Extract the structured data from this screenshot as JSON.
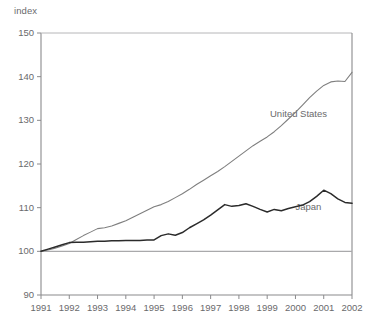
{
  "chart_data": {
    "type": "line",
    "title": "",
    "subtitle": "",
    "xlabel": "",
    "ylabel": "index",
    "unit_label": "index",
    "xlim": [
      1991,
      2002
    ],
    "ylim": [
      90,
      150
    ],
    "grid": false,
    "legend_position": "inline-annotation",
    "reference_line": 100,
    "ytick_labels": [
      "150",
      "140",
      "130",
      "120",
      "110",
      "100",
      "90"
    ],
    "ytick_values": [
      150,
      140,
      130,
      120,
      110,
      100,
      90
    ],
    "xtick_labels": [
      "1991",
      "1992",
      "1993",
      "1994",
      "1995",
      "1996",
      "1997",
      "1998",
      "1999",
      "2000",
      "2001",
      "2002"
    ],
    "xtick_values": [
      1991,
      1992,
      1993,
      1994,
      1995,
      1996,
      1997,
      1998,
      1999,
      2000,
      2001,
      2002
    ],
    "series": [
      {
        "name": "United States",
        "label": "United States",
        "color": "#7f7f7f",
        "annotation_x": 1999.1,
        "annotation_y": 131.2,
        "x": [
          1991.0,
          1991.25,
          1991.5,
          1991.75,
          1992.0,
          1992.25,
          1992.5,
          1992.75,
          1993.0,
          1993.25,
          1993.5,
          1993.75,
          1994.0,
          1994.25,
          1994.5,
          1994.75,
          1995.0,
          1995.25,
          1995.5,
          1995.75,
          1996.0,
          1996.25,
          1996.5,
          1996.75,
          1997.0,
          1997.25,
          1997.5,
          1997.75,
          1998.0,
          1998.25,
          1998.5,
          1998.75,
          1999.0,
          1999.25,
          1999.5,
          1999.75,
          2000.0,
          2000.25,
          2000.5,
          2000.75,
          2001.0,
          2001.25,
          2001.5,
          2001.75,
          2002.0
        ],
        "values": [
          100.0,
          100.3,
          100.7,
          101.2,
          101.8,
          102.7,
          103.6,
          104.4,
          105.2,
          105.4,
          105.8,
          106.4,
          107.0,
          107.8,
          108.6,
          109.4,
          110.2,
          110.7,
          111.4,
          112.3,
          113.2,
          114.2,
          115.3,
          116.3,
          117.3,
          118.3,
          119.4,
          120.6,
          121.8,
          123.0,
          124.2,
          125.2,
          126.2,
          127.4,
          128.8,
          130.3,
          131.8,
          133.5,
          135.2,
          136.7,
          138.0,
          138.8,
          139.0,
          138.9,
          141.0
        ]
      },
      {
        "name": "Japan",
        "label": "Japan",
        "color": "#2b2b2b",
        "annotation_x": 2000.0,
        "annotation_y": 110.0,
        "x": [
          1991.0,
          1991.25,
          1991.5,
          1991.75,
          1992.0,
          1992.25,
          1992.5,
          1992.75,
          1993.0,
          1993.25,
          1993.5,
          1993.75,
          1994.0,
          1994.25,
          1994.5,
          1994.75,
          1995.0,
          1995.25,
          1995.5,
          1995.75,
          1996.0,
          1996.25,
          1996.5,
          1996.75,
          1997.0,
          1997.25,
          1997.5,
          1997.75,
          1998.0,
          1998.25,
          1998.5,
          1998.75,
          1999.0,
          1999.25,
          1999.5,
          1999.75,
          2000.0,
          2000.25,
          2000.5,
          2000.75,
          2001.0,
          2001.25,
          2001.5,
          2001.75,
          2002.0
        ],
        "values": [
          100.0,
          100.5,
          101.0,
          101.5,
          102.0,
          102.1,
          102.1,
          102.2,
          102.3,
          102.3,
          102.4,
          102.4,
          102.5,
          102.5,
          102.5,
          102.6,
          102.6,
          103.6,
          104.0,
          103.7,
          104.3,
          105.4,
          106.3,
          107.2,
          108.3,
          109.5,
          110.7,
          110.3,
          110.5,
          110.9,
          110.3,
          109.6,
          109.0,
          109.6,
          109.3,
          109.8,
          110.2,
          110.6,
          111.4,
          112.6,
          114.0,
          113.2,
          112.0,
          111.2,
          111.0
        ]
      }
    ]
  },
  "plot": {
    "left_px": 41,
    "right_px": 352,
    "top_px": 33,
    "bottom_px": 295
  }
}
